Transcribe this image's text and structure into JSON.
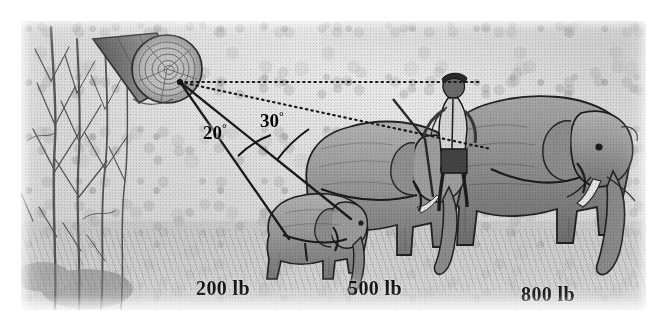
{
  "figure": {
    "kind": "physics-free-body-illustration",
    "background_color": "#d9d9d9",
    "ink_color": "#141414",
    "frame_color": "#ffffff"
  },
  "annotations": {
    "angles": [
      {
        "name": "angle-20",
        "value": "20",
        "degree_symbol": "°",
        "text": "20°"
      },
      {
        "name": "angle-30",
        "value": "30",
        "degree_symbol": "°",
        "text": "30°"
      }
    ],
    "weights": [
      {
        "name": "weight-small-elephant",
        "text": "200 lb",
        "number": "200",
        "unit": "lb"
      },
      {
        "name": "weight-middle-elephant",
        "text": "500 lb",
        "number": "500",
        "unit": "lb"
      },
      {
        "name": "weight-large-elephant",
        "text": "800 lb",
        "number": "800",
        "unit": "lb"
      }
    ]
  },
  "scene": {
    "log": {
      "name": "cut-log",
      "detail": "sawn log end with concentric growth rings"
    },
    "anchor": {
      "name": "rope-anchor-point"
    },
    "reference_line": {
      "name": "horizontal-reference-line",
      "style": "dotted"
    },
    "ropes": [
      {
        "name": "rope-to-small-elephant",
        "style": "solid"
      },
      {
        "name": "rope-to-middle-elephant",
        "style": "solid"
      },
      {
        "name": "rope-to-large-elephant",
        "style": "dotted"
      }
    ],
    "elephants": [
      {
        "name": "small-elephant"
      },
      {
        "name": "middle-elephant"
      },
      {
        "name": "large-elephant"
      }
    ],
    "mahout": {
      "name": "mahout-figure",
      "detail": "man standing on middle elephant holding a staff"
    },
    "trees": {
      "name": "background-trees",
      "detail": "bare saplings and branches at left"
    }
  }
}
